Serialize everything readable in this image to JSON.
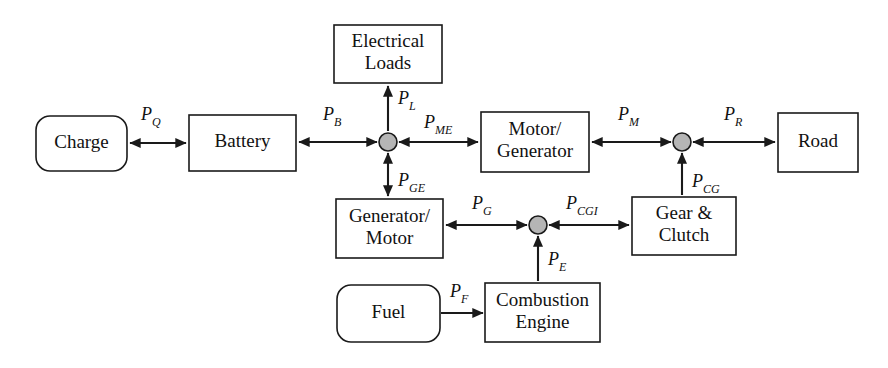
{
  "diagram": {
    "canvas": {
      "width": 888,
      "height": 368
    },
    "colors": {
      "background": "#ffffff",
      "stroke": "#1a1a1a",
      "box_fill": "#ffffff",
      "junction_fill": "#b5b5b5",
      "text": "#111111"
    },
    "blocks": [
      {
        "id": "charge",
        "label_lines": [
          "Charge"
        ],
        "shape": "rounded-rect",
        "x": 36,
        "y": 116,
        "w": 91,
        "h": 55,
        "rx": 14
      },
      {
        "id": "battery",
        "label_lines": [
          "Battery"
        ],
        "shape": "rect",
        "x": 189,
        "y": 115,
        "w": 107,
        "h": 56,
        "rx": 0
      },
      {
        "id": "electrical-loads",
        "label_lines": [
          "Electrical",
          "Loads"
        ],
        "shape": "rect",
        "x": 334,
        "y": 25,
        "w": 108,
        "h": 58,
        "rx": 0
      },
      {
        "id": "motor-generator",
        "label_lines": [
          "Motor/",
          "Generator"
        ],
        "shape": "rect",
        "x": 481,
        "y": 112,
        "w": 108,
        "h": 60,
        "rx": 0
      },
      {
        "id": "road",
        "label_lines": [
          "Road"
        ],
        "shape": "rect",
        "x": 778,
        "y": 113,
        "w": 80,
        "h": 59,
        "rx": 0
      },
      {
        "id": "generator-motor",
        "label_lines": [
          "Generator/",
          "Motor"
        ],
        "shape": "rect",
        "x": 336,
        "y": 199,
        "w": 107,
        "h": 59,
        "rx": 0
      },
      {
        "id": "gear-clutch",
        "label_lines": [
          "Gear &",
          "Clutch"
        ],
        "shape": "rect",
        "x": 632,
        "y": 197,
        "w": 104,
        "h": 58,
        "rx": 0
      },
      {
        "id": "fuel",
        "label_lines": [
          "Fuel"
        ],
        "shape": "rounded-rect",
        "x": 337,
        "y": 285,
        "w": 103,
        "h": 57,
        "rx": 14
      },
      {
        "id": "combustion-engine",
        "label_lines": [
          "Combustion",
          "Engine"
        ],
        "shape": "rect",
        "x": 485,
        "y": 283,
        "w": 115,
        "h": 59,
        "rx": 0
      }
    ],
    "junctions": [
      {
        "id": "node-electric",
        "cx": 388,
        "cy": 142,
        "r": 9
      },
      {
        "id": "node-drive",
        "cx": 682,
        "cy": 142,
        "r": 9
      },
      {
        "id": "node-engine",
        "cx": 538,
        "cy": 225,
        "r": 9
      }
    ],
    "flows": [
      {
        "id": "flow-pq",
        "symbol": "P",
        "subscript": "Q",
        "from": "charge",
        "to": "battery",
        "orientation": "horizontal",
        "bidirectional": true,
        "x1": 130,
        "y1": 143,
        "x2": 186,
        "y2": 143,
        "label_x": 141,
        "label_y": 120
      },
      {
        "id": "flow-pb",
        "symbol": "P",
        "subscript": "B",
        "from": "battery",
        "to": "node-electric",
        "orientation": "horizontal",
        "bidirectional": true,
        "x1": 299,
        "y1": 142,
        "x2": 377,
        "y2": 142,
        "label_x": 323,
        "label_y": 120
      },
      {
        "id": "flow-pl",
        "symbol": "P",
        "subscript": "L",
        "from": "node-electric",
        "to": "electrical-loads",
        "orientation": "vertical",
        "bidirectional": false,
        "x1": 388,
        "y1": 131,
        "x2": 388,
        "y2": 86,
        "label_x": 398,
        "label_y": 104
      },
      {
        "id": "flow-pme",
        "symbol": "P",
        "subscript": "ME",
        "from": "node-electric",
        "to": "motor-generator",
        "orientation": "horizontal",
        "bidirectional": true,
        "x1": 399,
        "y1": 142,
        "x2": 478,
        "y2": 142,
        "label_x": 424,
        "label_y": 128
      },
      {
        "id": "flow-pm",
        "symbol": "P",
        "subscript": "M",
        "from": "motor-generator",
        "to": "node-drive",
        "orientation": "horizontal",
        "bidirectional": true,
        "x1": 592,
        "y1": 142,
        "x2": 671,
        "y2": 142,
        "label_x": 618,
        "label_y": 120
      },
      {
        "id": "flow-pr",
        "symbol": "P",
        "subscript": "R",
        "from": "node-drive",
        "to": "road",
        "orientation": "horizontal",
        "bidirectional": true,
        "x1": 693,
        "y1": 142,
        "x2": 775,
        "y2": 142,
        "label_x": 724,
        "label_y": 120
      },
      {
        "id": "flow-pge",
        "symbol": "P",
        "subscript": "GE",
        "from": "node-electric",
        "to": "generator-motor",
        "orientation": "vertical",
        "bidirectional": true,
        "x1": 388,
        "y1": 153,
        "x2": 388,
        "y2": 196,
        "label_x": 398,
        "label_y": 186
      },
      {
        "id": "flow-pg",
        "symbol": "P",
        "subscript": "G",
        "from": "node-engine",
        "to": "generator-motor",
        "orientation": "horizontal",
        "bidirectional": true,
        "x1": 446,
        "y1": 225,
        "x2": 527,
        "y2": 225,
        "label_x": 472,
        "label_y": 209
      },
      {
        "id": "flow-pcgi",
        "symbol": "P",
        "subscript": "CGI",
        "from": "node-engine",
        "to": "gear-clutch",
        "orientation": "horizontal",
        "bidirectional": true,
        "x1": 549,
        "y1": 225,
        "x2": 629,
        "y2": 225,
        "label_x": 566,
        "label_y": 209
      },
      {
        "id": "flow-pcg",
        "symbol": "P",
        "subscript": "CG",
        "from": "gear-clutch",
        "to": "node-drive",
        "orientation": "vertical",
        "bidirectional": false,
        "x1": 682,
        "y1": 195,
        "x2": 682,
        "y2": 153,
        "label_x": 692,
        "label_y": 187
      },
      {
        "id": "flow-pe",
        "symbol": "P",
        "subscript": "E",
        "from": "combustion-engine",
        "to": "node-engine",
        "orientation": "vertical",
        "bidirectional": false,
        "x1": 538,
        "y1": 281,
        "x2": 538,
        "y2": 236,
        "label_x": 548,
        "label_y": 265
      },
      {
        "id": "flow-pf",
        "symbol": "P",
        "subscript": "F",
        "from": "fuel",
        "to": "combustion-engine",
        "orientation": "horizontal",
        "bidirectional": false,
        "x1": 441,
        "y1": 313,
        "x2": 483,
        "y2": 313,
        "label_x": 450,
        "label_y": 297
      }
    ]
  }
}
